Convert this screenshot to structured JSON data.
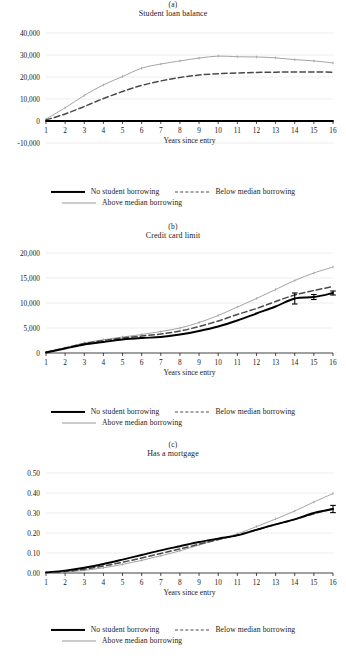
{
  "figure": {
    "xlabel": "Years since entry",
    "legend": {
      "series1": "No student borrowing",
      "series2": "Below median borrowing",
      "series3": "Above median borrowing"
    },
    "colors": {
      "no_borrowing": "#000000",
      "below_median": "#4a4a4a",
      "above_median": "#9a9a9a",
      "grid": "#d9d9d9",
      "axis": "#000000",
      "background": "#ffffff"
    }
  },
  "chart_data": [
    {
      "type": "line",
      "panel": "(a)",
      "title": "Student loan balance",
      "xlabel": "Years since entry",
      "ylabel": "",
      "x": [
        1,
        2,
        3,
        4,
        5,
        6,
        7,
        8,
        9,
        10,
        11,
        12,
        13,
        14,
        15,
        16
      ],
      "xlim": [
        1,
        16
      ],
      "ylim": [
        -10000,
        40000
      ],
      "yticks": [
        -10000,
        0,
        10000,
        20000,
        30000,
        40000
      ],
      "ytick_labels": [
        "-10,000",
        "0",
        "10,000",
        "20,000",
        "30,000",
        "40,000"
      ],
      "xticks": [
        1,
        2,
        3,
        4,
        5,
        6,
        7,
        8,
        9,
        10,
        11,
        12,
        13,
        14,
        15,
        16
      ],
      "grid": true,
      "legend_position": "below",
      "series": [
        {
          "name": "No student borrowing",
          "style": "solid-thick-black",
          "values": [
            0,
            0,
            0,
            0,
            0,
            0,
            0,
            0,
            0,
            0,
            0,
            0,
            0,
            0,
            0,
            0
          ]
        },
        {
          "name": "Below median borrowing",
          "style": "dashed-gray",
          "values": [
            500,
            3200,
            6600,
            10200,
            13400,
            16200,
            18200,
            19800,
            20900,
            21500,
            21800,
            22100,
            22200,
            22300,
            22300,
            22200
          ]
        },
        {
          "name": "Above median borrowing",
          "style": "solid-thin-gray",
          "values": [
            900,
            6000,
            11600,
            16400,
            20200,
            24000,
            25900,
            27300,
            28600,
            29500,
            29200,
            29100,
            28700,
            27900,
            27300,
            26400
          ]
        }
      ]
    },
    {
      "type": "line",
      "panel": "(b)",
      "title": "Credit card limit",
      "xlabel": "Years since entry",
      "ylabel": "",
      "x": [
        1,
        2,
        3,
        4,
        5,
        6,
        7,
        8,
        9,
        10,
        11,
        12,
        13,
        14,
        15,
        16
      ],
      "xlim": [
        1,
        16
      ],
      "ylim": [
        0,
        20000
      ],
      "yticks": [
        0,
        5000,
        10000,
        15000,
        20000
      ],
      "ytick_labels": [
        "0",
        "5,000",
        "10,000",
        "15,000",
        "20,000"
      ],
      "xticks": [
        1,
        2,
        3,
        4,
        5,
        6,
        7,
        8,
        9,
        10,
        11,
        12,
        13,
        14,
        15,
        16
      ],
      "grid": true,
      "legend_position": "below",
      "series": [
        {
          "name": "No student borrowing",
          "style": "solid-thick-black",
          "values": [
            100,
            900,
            1700,
            2200,
            2700,
            3000,
            3200,
            3700,
            4400,
            5300,
            6500,
            7900,
            9300,
            10900,
            11200,
            12000
          ],
          "errors": [
            0,
            0,
            0,
            0,
            0,
            0,
            0,
            0,
            0,
            0,
            0,
            0,
            0,
            1100,
            500,
            400
          ]
        },
        {
          "name": "Below median borrowing",
          "style": "dashed-gray",
          "values": [
            150,
            1000,
            1900,
            2500,
            3000,
            3400,
            3800,
            4400,
            5300,
            6400,
            7700,
            8900,
            10300,
            11600,
            12500,
            13300
          ]
        },
        {
          "name": "Above median borrowing",
          "style": "solid-thin-gray",
          "values": [
            150,
            1050,
            2000,
            2650,
            3200,
            3700,
            4300,
            5000,
            6100,
            7500,
            9200,
            10900,
            12700,
            14500,
            16000,
            17200
          ]
        }
      ]
    },
    {
      "type": "line",
      "panel": "(c)",
      "title": "Has a mortgage",
      "xlabel": "Years since entry",
      "ylabel": "",
      "x": [
        1,
        2,
        3,
        4,
        5,
        6,
        7,
        8,
        9,
        10,
        11,
        12,
        13,
        14,
        15,
        16
      ],
      "xlim": [
        1,
        16
      ],
      "ylim": [
        0,
        0.5
      ],
      "yticks": [
        0,
        0.1,
        0.2,
        0.3,
        0.4,
        0.5
      ],
      "ytick_labels": [
        "0.00",
        "0.10",
        "0.20",
        "0.30",
        "0.40",
        "0.50"
      ],
      "xticks": [
        1,
        2,
        3,
        4,
        5,
        6,
        7,
        8,
        9,
        10,
        11,
        12,
        13,
        14,
        15,
        16
      ],
      "grid": true,
      "legend_position": "below",
      "series": [
        {
          "name": "No student borrowing",
          "style": "solid-thick-black",
          "values": [
            0.003,
            0.012,
            0.026,
            0.045,
            0.067,
            0.09,
            0.113,
            0.134,
            0.155,
            0.172,
            0.188,
            0.216,
            0.243,
            0.268,
            0.3,
            0.32
          ],
          "errors": [
            0,
            0,
            0,
            0,
            0,
            0,
            0,
            0,
            0,
            0,
            0,
            0,
            0,
            0,
            0,
            0.018
          ]
        },
        {
          "name": "Below median borrowing",
          "style": "dashed-gray",
          "values": [
            0.002,
            0.008,
            0.019,
            0.035,
            0.054,
            0.075,
            0.098,
            0.12,
            0.144,
            0.167,
            0.19,
            0.216,
            0.243,
            0.268,
            0.296,
            0.322
          ]
        },
        {
          "name": "Above median borrowing",
          "style": "solid-thin-gray",
          "values": [
            0.001,
            0.005,
            0.013,
            0.026,
            0.043,
            0.063,
            0.086,
            0.111,
            0.14,
            0.168,
            0.196,
            0.232,
            0.27,
            0.31,
            0.355,
            0.397
          ]
        }
      ]
    }
  ]
}
